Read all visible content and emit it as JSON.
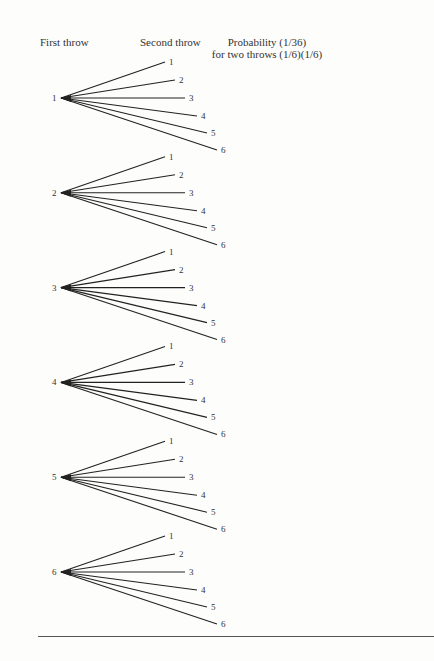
{
  "headers": {
    "first_throw": "First throw",
    "second_throw": "Second throw",
    "probability_line1": "Probability (1/36)",
    "probability_line2": "for two throws (1/6)(1/6)"
  },
  "tree": {
    "first_throw_outcomes": [
      "1",
      "2",
      "3",
      "4",
      "5",
      "6"
    ],
    "second_throw_outcomes": [
      "1",
      "2",
      "3",
      "4",
      "5",
      "6"
    ],
    "line_color": "#222222"
  }
}
